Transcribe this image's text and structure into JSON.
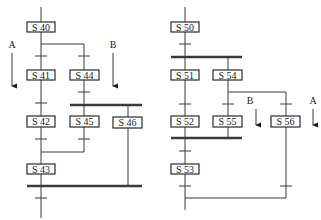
{
  "diagrams": {
    "left": {
      "steps": {
        "s40": "S 40",
        "s41": "S 41",
        "s42": "S 42",
        "s43": "S 43",
        "s44": "S 44",
        "s45": "S 45",
        "s46": "S 46"
      },
      "signals": {
        "a": "A",
        "b": "B"
      }
    },
    "right": {
      "steps": {
        "s50": "S 50",
        "s51": "S 51",
        "s52": "S 52",
        "s53": "S 53",
        "s54": "S 54",
        "s55": "S 55",
        "s56": "S 56"
      },
      "signals": {
        "a": "A",
        "b": "B"
      }
    }
  },
  "colors": {
    "line": "#3a3a3a",
    "box_border": "#2a2a2a",
    "background": "#ffffff"
  }
}
